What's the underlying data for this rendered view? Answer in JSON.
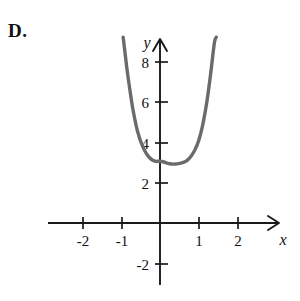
{
  "question_label": "D.",
  "axes": {
    "x_axis_label": "x",
    "y_axis_label": "y",
    "x_ticks": [
      "-2",
      "-1",
      "1",
      "2"
    ],
    "y_ticks": [
      "8",
      "6",
      "4",
      "2",
      "-2"
    ],
    "arrow_x": "x-axis-arrow",
    "arrow_y": "y-axis-arrow"
  },
  "style": {
    "curve_color": "#6b6b6b",
    "axis_color": "#1a1a1a",
    "background": "#ffffff",
    "curve_width": 3.4
  },
  "chart_data": {
    "type": "line",
    "title": "",
    "xlabel": "x",
    "ylabel": "y",
    "xlim": [
      -2.6,
      2.8
    ],
    "ylim": [
      -2.8,
      9.2
    ],
    "grid": false,
    "legend": null,
    "xticks": [
      -2,
      -1,
      1,
      2
    ],
    "yticks": [
      -2,
      2,
      4,
      6,
      8
    ],
    "series": [
      {
        "name": "curve",
        "x": [
          -0.95,
          -0.9,
          -0.85,
          -0.8,
          -0.75,
          -0.7,
          -0.65,
          -0.6,
          -0.55,
          -0.5,
          -0.4,
          -0.3,
          -0.2,
          -0.1,
          0.0,
          0.1,
          0.2,
          0.3,
          0.4,
          0.5,
          0.6,
          0.7,
          0.8,
          0.9,
          1.0,
          1.1,
          1.2,
          1.3,
          1.4,
          1.45
        ],
        "y": [
          9.2,
          8.4,
          7.6,
          6.9,
          6.25,
          5.65,
          5.15,
          4.7,
          4.35,
          4.05,
          3.6,
          3.3,
          3.12,
          3.05,
          3.06,
          3.02,
          2.95,
          2.92,
          2.92,
          2.95,
          3.0,
          3.1,
          3.3,
          3.62,
          4.1,
          4.85,
          5.9,
          7.3,
          8.9,
          9.2
        ]
      }
    ]
  }
}
